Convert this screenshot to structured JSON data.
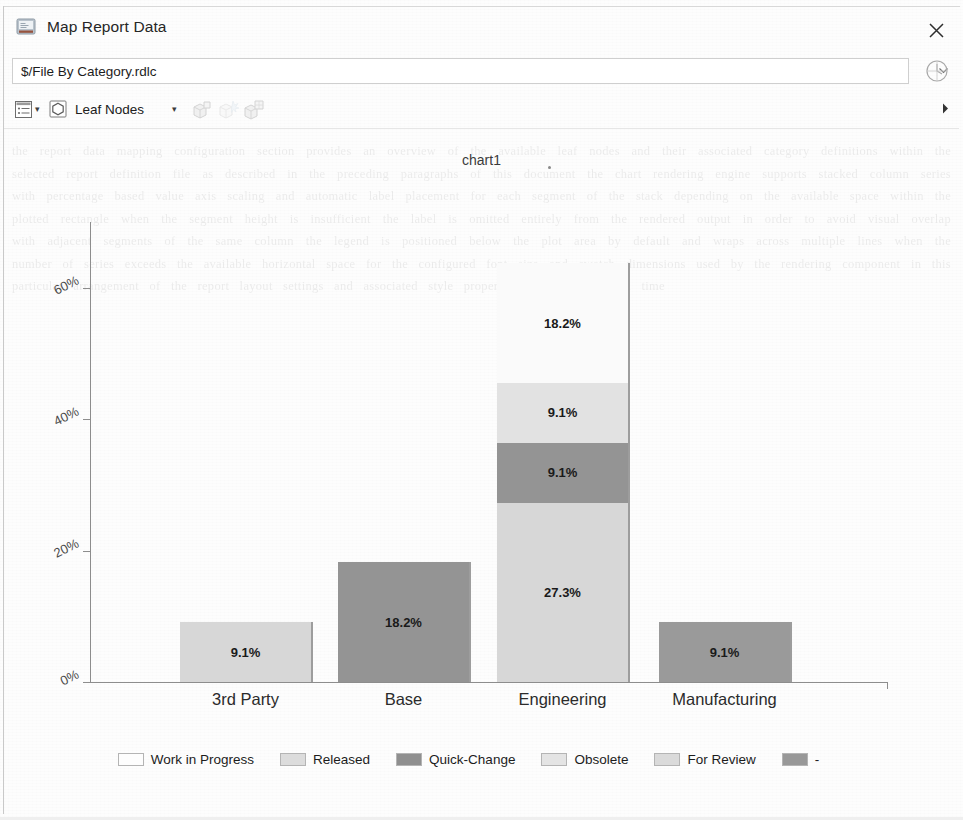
{
  "window": {
    "title": "Map Report Data",
    "title_icon": "report-window-icon",
    "close_label": "✕"
  },
  "pathbar": {
    "value": "$/File By Category.rdlc",
    "placeholder": "",
    "dropdown_icon": "chevron-down-icon",
    "history_icon": "history-clock-icon"
  },
  "toolbar": {
    "report_icon": "report-list-icon",
    "report_caret": "▾",
    "nodes_icon": "hexagon-node-icon",
    "nodes_label": "Leaf Nodes",
    "nodes_caret": "▾",
    "box1_icon": "package-box-icon",
    "box2_icon": "package-burst-icon",
    "box3_icon": "package-stack-icon",
    "overflow_icon": "overflow-arrow-icon"
  },
  "chart_data": {
    "type": "bar",
    "title": "chart1",
    "stacked": true,
    "xlabel": "",
    "ylabel": "",
    "ylim": [
      0,
      70
    ],
    "ytick_values": [
      0,
      20,
      40,
      60
    ],
    "ytick_labels": [
      "0%",
      "20%",
      "40%",
      "60%"
    ],
    "grid": false,
    "legend_position": "bottom",
    "categories": [
      "3rd Party",
      "Base",
      "Engineering",
      "Manufacturing"
    ],
    "series": [
      {
        "name": "Work in Progress",
        "color": "#fbfbfb",
        "values": [
          0,
          0,
          0,
          0
        ],
        "labels": [
          "",
          "",
          "",
          ""
        ]
      },
      {
        "name": "Released",
        "color": "#d7d7d7",
        "values": [
          9.1,
          0,
          27.3,
          0
        ],
        "labels": [
          "9.1%",
          "",
          "27.3%",
          ""
        ]
      },
      {
        "name": "Quick-Change",
        "color": "#949494",
        "values": [
          0,
          18.2,
          9.1,
          0
        ],
        "labels": [
          "",
          "18.2%",
          "9.1%",
          ""
        ]
      },
      {
        "name": "Obsolete",
        "color": "#e2e2e2",
        "values": [
          0,
          0,
          9.1,
          0
        ],
        "labels": [
          "",
          "",
          "9.1%",
          ""
        ]
      },
      {
        "name": "For Review",
        "color": "#fafafa",
        "values": [
          0,
          0,
          18.2,
          0
        ],
        "labels": [
          "",
          "",
          "18.2%",
          ""
        ]
      },
      {
        "name": "-",
        "color": "#9a9a9a",
        "values": [
          0,
          0,
          0,
          9.1
        ],
        "labels": [
          "",
          "",
          "",
          "9.1%"
        ]
      }
    ],
    "bar_totals": [
      9.1,
      18.2,
      63.7,
      9.1
    ],
    "annotations": []
  },
  "legend": {
    "items": [
      {
        "label": "Work in Progress",
        "color": "#fdfdfd"
      },
      {
        "label": "Released",
        "color": "#dcdcdc"
      },
      {
        "label": "Quick-Change",
        "color": "#8f8f8f"
      },
      {
        "label": "Obsolete",
        "color": "#e4e4e4"
      },
      {
        "label": "For Review",
        "color": "#dadada"
      },
      {
        "label": "-",
        "color": "#989898"
      }
    ]
  },
  "ghost": {
    "text": "the report data mapping configuration section provides an overview of the available leaf nodes and their associated category definitions within the selected report definition file as described in the preceding paragraphs of this document the chart rendering engine supports stacked column series with percentage based value axis scaling and automatic label placement for each segment of the stack depending on the available space within the plotted rectangle when the segment height is insufficient the label is omitted entirely from the rendered output in order to avoid visual overlap with adjacent segments of the same column the legend is positioned below the plot area by default and wraps across multiple lines when the number of series exceeds the available horizontal space for the configured font size and swatch dimensions used by the rendering component in this particular arrangement of the report layout settings and associated style properties applied at design time"
  }
}
